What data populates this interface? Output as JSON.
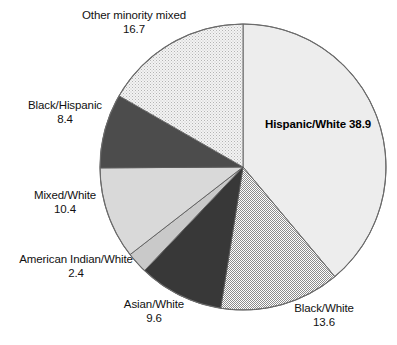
{
  "chart_data": {
    "type": "pie",
    "title": "",
    "subtitle": "",
    "xlabel": "",
    "ylabel": "",
    "legend_position": "none",
    "grid": false,
    "start_angle_deg": 0,
    "direction": "clockwise",
    "total": 100.0,
    "units": "percent",
    "categories": [
      "Hispanic/White",
      "Black/White",
      "Asian/White",
      "American Indian/White",
      "Mixed/White",
      "Black/Hispanic",
      "Other minority mixed"
    ],
    "values": [
      38.9,
      13.6,
      9.6,
      2.4,
      10.4,
      8.4,
      16.7
    ],
    "slices": [
      {
        "label": "Hispanic/White",
        "value": "38.9",
        "numeric": 38.9,
        "fill": "#ededed",
        "pattern": "solid",
        "label_placement": "inside",
        "label_bold": true
      },
      {
        "label": "Black/White",
        "value": "13.6",
        "numeric": 13.6,
        "fill": "#bdbdbd",
        "pattern": "checker",
        "label_placement": "outside",
        "label_bold": false
      },
      {
        "label": "Asian/White",
        "value": "9.6",
        "numeric": 9.6,
        "fill": "#383838",
        "pattern": "solid",
        "label_placement": "outside",
        "label_bold": false
      },
      {
        "label": "American Indian/White",
        "value": "2.4",
        "numeric": 2.4,
        "fill": "#c9c9c9",
        "pattern": "solid",
        "label_placement": "outside",
        "label_bold": false
      },
      {
        "label": "Mixed/White",
        "value": "10.4",
        "numeric": 10.4,
        "fill": "#d9d9d9",
        "pattern": "solid",
        "label_placement": "outside",
        "label_bold": false
      },
      {
        "label": "Black/Hispanic",
        "value": "8.4",
        "numeric": 8.4,
        "fill": "#4c4c4c",
        "pattern": "solid",
        "label_placement": "outside",
        "label_bold": false
      },
      {
        "label": "Other minority mixed",
        "value": "16.7",
        "numeric": 16.7,
        "fill": "#e2e2e2",
        "pattern": "stipple",
        "label_placement": "outside",
        "label_bold": false
      }
    ]
  },
  "colors": {
    "background": "#ffffff",
    "outline": "#5a5a5a",
    "text": "#111111"
  }
}
